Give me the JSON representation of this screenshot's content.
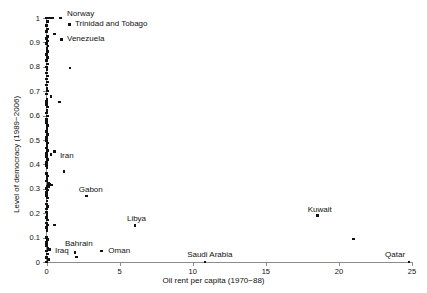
{
  "chart_data": {
    "type": "scatter",
    "title": "",
    "xlabel": "Oil rent per capita (1970−88)",
    "ylabel": "Level of democracy (1989−2006)",
    "xlim": [
      0,
      25
    ],
    "ylim": [
      0,
      1
    ],
    "xticks": [
      0,
      5,
      10,
      15,
      20,
      25
    ],
    "xtick_labels": [
      "0",
      "5",
      "10",
      "15",
      "20",
      "25"
    ],
    "yticks": [
      0,
      0.1,
      0.2,
      0.3,
      0.4,
      0.5,
      0.6,
      0.7,
      0.8,
      0.9,
      1
    ],
    "ytick_labels": [
      "0",
      "0.1",
      "0.2",
      "0.3",
      "0.4",
      "0.5",
      "0.6",
      "0.7",
      "0.8",
      "0.9",
      "1"
    ],
    "grid": false,
    "legend": "none",
    "marker": "filled-square",
    "marker_color": "#111111",
    "axis_color": "#8c8c8c",
    "annotations": [
      {
        "label": "Norway",
        "x": 0.45,
        "y": 1.0,
        "label_dx": 14,
        "label_dy": -9
      },
      {
        "label": "Trinidad and Tobago",
        "x": 1.05,
        "y": 0.955,
        "label_dx": 9,
        "label_dy": -4
      },
      {
        "label": "Venezuela",
        "x": 0.75,
        "y": 0.9,
        "label_dx": 9,
        "label_dy": -4
      },
      {
        "label": "Iran",
        "x": 0.3,
        "y": 0.44,
        "label_dx": 9,
        "label_dy": -4
      },
      {
        "label": "Gabon",
        "x": 2.75,
        "y": 0.27,
        "label_dx": -8,
        "label_dy": -11
      },
      {
        "label": "Libya",
        "x": 6.05,
        "y": 0.15,
        "label_dx": -8,
        "label_dy": -11
      },
      {
        "label": "Kuwait",
        "x": 18.55,
        "y": 0.19,
        "label_dx": -10,
        "label_dy": -11
      },
      {
        "label": "Bahrain",
        "x": 1.95,
        "y": 0.04,
        "label_dx": -10,
        "label_dy": -13
      },
      {
        "label": "Iraq",
        "x": 0.1,
        "y": 0.055,
        "label_dx": 7,
        "label_dy": -3
      },
      {
        "label": "Oman",
        "x": 3.75,
        "y": 0.045,
        "label_dx": 7,
        "label_dy": -5
      },
      {
        "label": "Saudi Arabia",
        "x": 10.85,
        "y": 0.0,
        "label_dx": -18,
        "label_dy": -12
      },
      {
        "label": "Qatar",
        "x": 24.8,
        "y": 0.0,
        "label_dx": -24,
        "label_dy": -12
      }
    ],
    "points": [
      {
        "x": 0.0,
        "y": 1.0
      },
      {
        "x": 0.12,
        "y": 1.0
      },
      {
        "x": 0.22,
        "y": 1.0
      },
      {
        "x": 0.33,
        "y": 1.0
      },
      {
        "x": 0.45,
        "y": 1.0
      },
      {
        "x": 0.95,
        "y": 1.0
      },
      {
        "x": 0.05,
        "y": 0.985
      },
      {
        "x": 0.02,
        "y": 0.97
      },
      {
        "x": 0.05,
        "y": 0.955
      },
      {
        "x": 0.0,
        "y": 0.945
      },
      {
        "x": 0.55,
        "y": 0.935
      },
      {
        "x": 0.08,
        "y": 0.925
      },
      {
        "x": 0.02,
        "y": 0.915
      },
      {
        "x": 0.05,
        "y": 0.905
      },
      {
        "x": 0.0,
        "y": 0.895
      },
      {
        "x": 0.1,
        "y": 0.885
      },
      {
        "x": 0.03,
        "y": 0.875
      },
      {
        "x": 0.06,
        "y": 0.862
      },
      {
        "x": 0.0,
        "y": 0.85
      },
      {
        "x": 0.08,
        "y": 0.838
      },
      {
        "x": 0.02,
        "y": 0.825
      },
      {
        "x": 0.05,
        "y": 0.812
      },
      {
        "x": 0.0,
        "y": 0.8
      },
      {
        "x": 1.6,
        "y": 0.795
      },
      {
        "x": 0.04,
        "y": 0.788
      },
      {
        "x": 0.0,
        "y": 0.775
      },
      {
        "x": 0.07,
        "y": 0.762
      },
      {
        "x": 0.02,
        "y": 0.75
      },
      {
        "x": 0.05,
        "y": 0.738
      },
      {
        "x": 0.0,
        "y": 0.725
      },
      {
        "x": 0.03,
        "y": 0.712
      },
      {
        "x": 0.06,
        "y": 0.7
      },
      {
        "x": 0.0,
        "y": 0.688
      },
      {
        "x": 0.3,
        "y": 0.678
      },
      {
        "x": 0.04,
        "y": 0.668
      },
      {
        "x": 0.02,
        "y": 0.658
      },
      {
        "x": 0.9,
        "y": 0.655
      },
      {
        "x": 0.0,
        "y": 0.645
      },
      {
        "x": 0.06,
        "y": 0.635
      },
      {
        "x": 0.03,
        "y": 0.622
      },
      {
        "x": 0.0,
        "y": 0.61
      },
      {
        "x": 0.05,
        "y": 0.598
      },
      {
        "x": 0.02,
        "y": 0.585
      },
      {
        "x": 0.0,
        "y": 0.572
      },
      {
        "x": 0.07,
        "y": 0.56
      },
      {
        "x": 0.03,
        "y": 0.548
      },
      {
        "x": 0.0,
        "y": 0.535
      },
      {
        "x": 0.05,
        "y": 0.522
      },
      {
        "x": 0.02,
        "y": 0.51
      },
      {
        "x": 0.0,
        "y": 0.498
      },
      {
        "x": 0.08,
        "y": 0.488
      },
      {
        "x": 0.03,
        "y": 0.478
      },
      {
        "x": 0.0,
        "y": 0.468
      },
      {
        "x": 0.05,
        "y": 0.458
      },
      {
        "x": 0.55,
        "y": 0.452
      },
      {
        "x": 0.02,
        "y": 0.445
      },
      {
        "x": 0.0,
        "y": 0.432
      },
      {
        "x": 0.3,
        "y": 0.44
      },
      {
        "x": 0.06,
        "y": 0.42
      },
      {
        "x": 0.02,
        "y": 0.408
      },
      {
        "x": 0.0,
        "y": 0.395
      },
      {
        "x": 0.04,
        "y": 0.385
      },
      {
        "x": 1.2,
        "y": 0.372
      },
      {
        "x": 0.0,
        "y": 0.362
      },
      {
        "x": 0.08,
        "y": 0.352
      },
      {
        "x": 0.03,
        "y": 0.342
      },
      {
        "x": 0.0,
        "y": 0.332
      },
      {
        "x": 0.12,
        "y": 0.322
      },
      {
        "x": 0.25,
        "y": 0.318
      },
      {
        "x": 0.38,
        "y": 0.315
      },
      {
        "x": 0.05,
        "y": 0.312
      },
      {
        "x": 0.18,
        "y": 0.308
      },
      {
        "x": 0.0,
        "y": 0.302
      },
      {
        "x": 0.07,
        "y": 0.295
      },
      {
        "x": 0.02,
        "y": 0.285
      },
      {
        "x": 2.75,
        "y": 0.27
      },
      {
        "x": 0.0,
        "y": 0.272
      },
      {
        "x": 0.05,
        "y": 0.262
      },
      {
        "x": 0.03,
        "y": 0.25
      },
      {
        "x": 0.0,
        "y": 0.238
      },
      {
        "x": 0.06,
        "y": 0.228
      },
      {
        "x": 0.02,
        "y": 0.218
      },
      {
        "x": 0.0,
        "y": 0.205
      },
      {
        "x": 0.04,
        "y": 0.195
      },
      {
        "x": 18.55,
        "y": 0.19
      },
      {
        "x": 0.0,
        "y": 0.182
      },
      {
        "x": 0.08,
        "y": 0.172
      },
      {
        "x": 0.02,
        "y": 0.16
      },
      {
        "x": 6.05,
        "y": 0.15
      },
      {
        "x": 0.05,
        "y": 0.152
      },
      {
        "x": 0.55,
        "y": 0.152
      },
      {
        "x": 0.0,
        "y": 0.142
      },
      {
        "x": 0.03,
        "y": 0.13
      },
      {
        "x": 21.0,
        "y": 0.095
      },
      {
        "x": 0.0,
        "y": 0.1
      },
      {
        "x": 0.06,
        "y": 0.092
      },
      {
        "x": 0.02,
        "y": 0.08
      },
      {
        "x": 0.0,
        "y": 0.068
      },
      {
        "x": 0.1,
        "y": 0.055
      },
      {
        "x": 0.22,
        "y": 0.052
      },
      {
        "x": 0.0,
        "y": 0.045
      },
      {
        "x": 1.95,
        "y": 0.04
      },
      {
        "x": 2.05,
        "y": 0.02
      },
      {
        "x": 3.75,
        "y": 0.045
      },
      {
        "x": 0.05,
        "y": 0.032
      },
      {
        "x": 0.0,
        "y": 0.018
      },
      {
        "x": 0.14,
        "y": 0.01
      },
      {
        "x": 0.0,
        "y": 0.0
      },
      {
        "x": 10.85,
        "y": 0.0
      },
      {
        "x": 24.8,
        "y": 0.0
      }
    ]
  }
}
